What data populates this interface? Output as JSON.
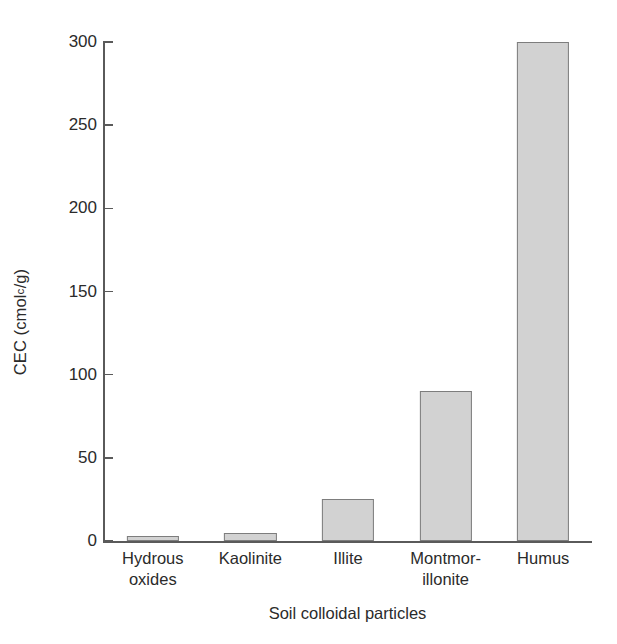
{
  "chart_data": {
    "type": "bar",
    "title": "",
    "subtitle": "",
    "xlabel": "Soil colloidal particles",
    "ylabel": "CEC (cmol<sub>c</sub>/g)",
    "ylabel_prefix": "CEC (cmol",
    "ylabel_subscript": "c",
    "ylabel_suffix": "/g)",
    "categories": [
      "Hydrous oxides",
      "Kaolinite",
      "Illite",
      "Montmorillonite",
      "Humus"
    ],
    "category_lines": [
      [
        "Hydrous",
        "oxides"
      ],
      [
        "Kaolinite",
        ""
      ],
      [
        "Illite",
        ""
      ],
      [
        "Montmor-",
        "illonite"
      ],
      [
        "Humus",
        ""
      ]
    ],
    "values": [
      3,
      5,
      25,
      90,
      300
    ],
    "ylim": [
      0,
      300
    ],
    "yticks": [
      0,
      50,
      100,
      150,
      200,
      250,
      300
    ],
    "ytick_labels": [
      "0",
      "50",
      "100",
      "150",
      "200",
      "250",
      "300"
    ],
    "xticks": [],
    "grid": false,
    "legend": null,
    "legend_position": "none",
    "bar_fill_color": "#d2d2d2",
    "bar_edge_color": "#7d7d7d",
    "axis_color": "#5a5a5a",
    "text_color": "#2b2b2b",
    "background_color": "#ffffff"
  }
}
